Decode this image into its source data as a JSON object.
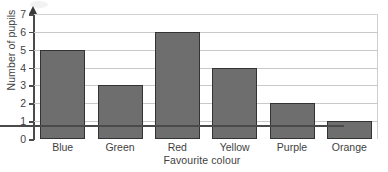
{
  "chart_data": {
    "type": "bar",
    "title": "",
    "categories": [
      "Blue",
      "Green",
      "Red",
      "Yellow",
      "Purple",
      "Orange"
    ],
    "values": [
      5,
      3,
      6,
      4,
      2,
      1
    ],
    "xlabel": "Favourite colour",
    "ylabel": "Number of pupils",
    "ylim": [
      0,
      7
    ],
    "yticks": [
      0,
      1,
      2,
      3,
      4,
      5,
      6,
      7
    ],
    "ytick_labels": [
      "0",
      "1",
      "2",
      "3",
      "4",
      "5",
      "6",
      "7"
    ],
    "grid": true,
    "legend": false,
    "bar_color": "#6e6e6e",
    "bar_edge_color": "#333333",
    "gridline_color": "#c9c9c9",
    "axis_color": "#4a4a4a"
  }
}
